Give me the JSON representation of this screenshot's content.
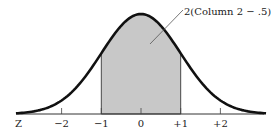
{
  "chart_data": {
    "type": "area",
    "title": "",
    "xlabel": "Z",
    "ylabel": "",
    "x_ticks": [
      "−2",
      "−1",
      "0",
      "+1",
      "+2"
    ],
    "x_tick_values": [
      -2,
      -1,
      0,
      1,
      2
    ],
    "xlim": [
      -3,
      3
    ],
    "shaded_region": [
      -1,
      1
    ],
    "annotation": "2(Column 2 − .5)",
    "colors": {
      "curve": "#111111",
      "shade": "#c8c8c8",
      "axis": "#333333"
    }
  },
  "axis": {
    "label": "Z"
  },
  "ticks": [
    "−2",
    "−1",
    "0",
    "+1",
    "+2"
  ],
  "annotation": {
    "text": "2(Column 2 − .5)"
  }
}
